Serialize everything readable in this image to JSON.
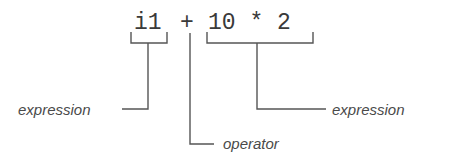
{
  "diagram": {
    "code_tokens": [
      {
        "id": "left-operand",
        "text": "i1"
      },
      {
        "id": "operator",
        "text": "+"
      },
      {
        "id": "right-operand",
        "text": "10 * 2"
      }
    ],
    "labels": {
      "left": "expression",
      "operator": "operator",
      "right": "expression"
    },
    "colors": {
      "text": "#3a3a3a",
      "label": "#4a4a4a",
      "line": "#555555",
      "background": "#ffffff"
    }
  }
}
